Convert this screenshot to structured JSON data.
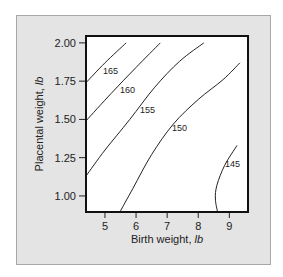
{
  "chart_data": {
    "type": "contour",
    "title": "",
    "xlabel": "Birth weight, lb",
    "xlabel_main": "Birth weight, ",
    "xlabel_unit": "lb",
    "ylabel": "Placental weight, lb",
    "ylabel_main": "Placental weight, ",
    "ylabel_unit": "lb",
    "xlim": [
      4.39,
      9.6
    ],
    "ylim": [
      0.895,
      2.045
    ],
    "x_ticks": [
      5,
      6,
      7,
      8,
      9
    ],
    "x_tick_labels": [
      "5",
      "6",
      "7",
      "8",
      "9"
    ],
    "y_ticks": [
      1.0,
      1.25,
      1.5,
      1.75,
      2.0
    ],
    "y_tick_labels": [
      "1.00",
      "1.25",
      "1.50",
      "1.75",
      "2.00"
    ],
    "grid": false,
    "legend": "none",
    "contours": [
      {
        "level": 165,
        "label": "165",
        "points": [
          [
            4.39,
            1.74
          ],
          [
            5.0,
            1.87
          ],
          [
            5.68,
            2.0
          ]
        ]
      },
      {
        "level": 160,
        "label": "160",
        "points": [
          [
            4.39,
            1.49
          ],
          [
            5.2,
            1.67
          ],
          [
            6.0,
            1.84
          ],
          [
            6.78,
            2.0
          ]
        ]
      },
      {
        "level": 155,
        "label": "155",
        "points": [
          [
            4.39,
            1.13
          ],
          [
            5.0,
            1.3
          ],
          [
            5.8,
            1.5
          ],
          [
            6.6,
            1.71
          ],
          [
            7.4,
            1.88
          ],
          [
            8.18,
            2.0
          ]
        ]
      },
      {
        "level": 150,
        "label": "150",
        "points": [
          [
            5.48,
            0.895
          ],
          [
            5.9,
            1.05
          ],
          [
            6.5,
            1.27
          ],
          [
            7.2,
            1.47
          ],
          [
            8.0,
            1.63
          ],
          [
            8.8,
            1.76
          ],
          [
            9.34,
            1.87
          ]
        ]
      },
      {
        "level": 145,
        "label": "145",
        "points": [
          [
            9.25,
            1.33
          ],
          [
            8.85,
            1.2
          ],
          [
            8.6,
            1.07
          ],
          [
            8.55,
            0.98
          ],
          [
            8.62,
            0.895
          ]
        ]
      }
    ]
  }
}
